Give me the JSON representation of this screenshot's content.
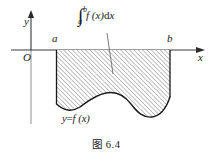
{
  "figure": {
    "caption_prefix": "图",
    "caption_number": "6.4",
    "caption_full": "图 6.4"
  },
  "axes": {
    "y_label": "y",
    "x_label": "x",
    "origin_label": "O",
    "tick_a": "a",
    "tick_b": "b",
    "axis_color": "#333333",
    "axis_below_color": "#999999"
  },
  "integral": {
    "symbol": "∫",
    "upper_limit": "b",
    "lower_limit": "a",
    "integrand": "f (x)",
    "differential": "d",
    "differential_var": "x",
    "full_text": "∫ab f (x)dx"
  },
  "curve": {
    "label_y": "y",
    "label_eq": "=",
    "label_fx": "f (x)",
    "label_full": "y=f (x)",
    "stroke_color": "#1a1a1a",
    "hatch_color": "#555555"
  },
  "region": {
    "fill": "#ffffff",
    "hatch_angle_deg": 45,
    "hatch_spacing_px": 3
  }
}
